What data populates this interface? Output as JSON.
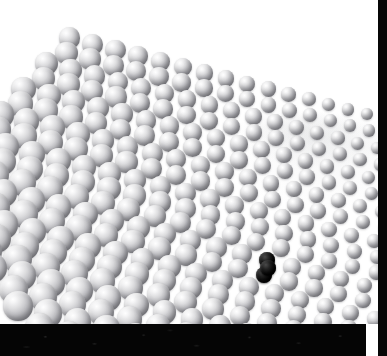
{
  "image": {
    "title": "Colloidal sphere monolayer micrograph",
    "subject": "hexagonal close-packed sphere array with size gradient",
    "width_px": 387,
    "height_px": 356
  },
  "colors": {
    "background": "#ffffff",
    "sphere_highlight": "#ffffff",
    "sphere_midtone": "#bebec2",
    "sphere_shadow": "#6e6e74",
    "defect_particle": "#000000",
    "bottom_band": "#050505",
    "right_strip": "#070707"
  },
  "regions": {
    "field": {
      "label": "imaging field",
      "x": 0,
      "y": 0,
      "width": 378,
      "height": 324
    },
    "bottom_band": {
      "label": "dark bottom band",
      "x": 0,
      "y": 324,
      "width": 378,
      "height": 32
    },
    "right_strip": {
      "label": "dark right strip",
      "x": 378,
      "y": 0,
      "width": 9,
      "height": 356
    },
    "empty_corner": {
      "label": "blank upper-right corner",
      "x": 200,
      "y": 0,
      "width": 178,
      "height": 120
    }
  },
  "annotations": {
    "defect": {
      "name": "black defect particle",
      "x": 268,
      "y": 268,
      "radius": 8,
      "color": "#000000"
    }
  },
  "lattice": {
    "type": "hexagonal",
    "rows": 21,
    "row_pitch_px": 15.6,
    "row_slope": 0.255,
    "origin_x": -34,
    "origin_y": 12,
    "size_gradient": {
      "description": "sphere diameter decreases left-to-right and top-to-bottom-right",
      "diameter_max_px": 31,
      "diameter_min_px": 12
    },
    "spacing_gradient": {
      "description": "center-to-center spacing grows relative to diameter toward the right, opening gaps",
      "packed_fraction_left": 1.0,
      "packed_fraction_right": 1.55
    }
  }
}
